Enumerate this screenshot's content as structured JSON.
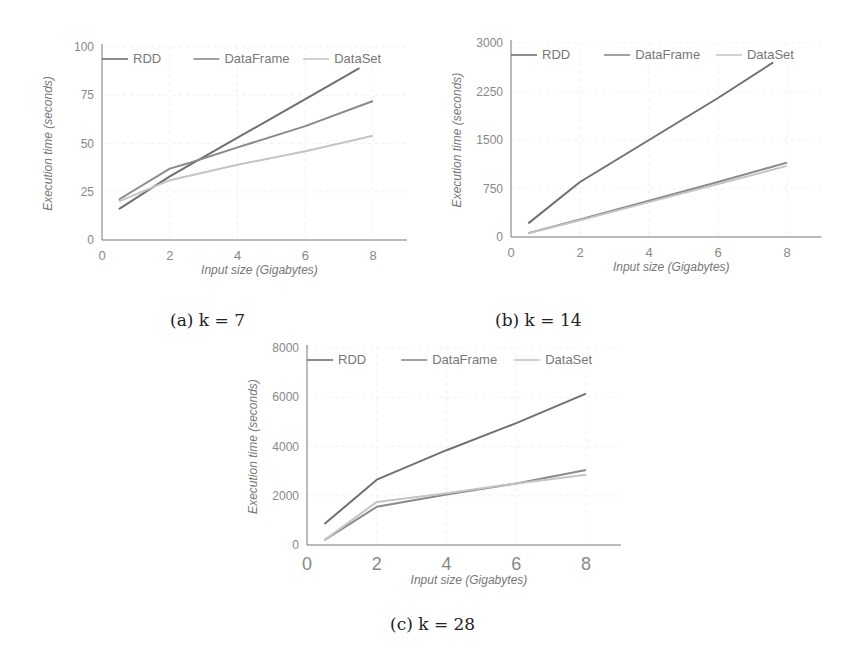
{
  "chart_data": [
    {
      "id": "a",
      "type": "line",
      "caption": "(a) k = 7",
      "xlabel": "Input size (Gigabytes)",
      "ylabel": "Execution time (seconds)",
      "xlim": [
        0,
        9
      ],
      "ylim": [
        0,
        100
      ],
      "xticks": [
        0,
        2,
        4,
        6,
        8
      ],
      "yticks": [
        0,
        25,
        50,
        75,
        100
      ],
      "grid": true,
      "legend_position": "top",
      "series": [
        {
          "name": "RDD",
          "color": "#707070",
          "x": [
            0.5,
            2,
            4,
            6,
            7.6
          ],
          "y": [
            16,
            33,
            53,
            73,
            89
          ]
        },
        {
          "name": "DataFrame",
          "color": "#8a8a8a",
          "x": [
            0.5,
            2,
            2.6,
            4,
            6,
            8
          ],
          "y": [
            21,
            37,
            40,
            48,
            59,
            72
          ]
        },
        {
          "name": "DataSet",
          "color": "#c4c4c4",
          "x": [
            0.5,
            2,
            4,
            6,
            8
          ],
          "y": [
            20,
            31,
            39,
            46,
            54
          ]
        }
      ]
    },
    {
      "id": "b",
      "type": "line",
      "caption": "(b) k = 14",
      "xlabel": "Input size (Gigabytes)",
      "ylabel": "Execution time (seconds)",
      "xlim": [
        0,
        9
      ],
      "ylim": [
        0,
        3000
      ],
      "xticks": [
        0,
        2,
        4,
        6,
        8
      ],
      "yticks": [
        0,
        750,
        1500,
        2250,
        3000
      ],
      "grid": true,
      "legend_position": "top",
      "series": [
        {
          "name": "RDD",
          "color": "#707070",
          "x": [
            0.5,
            2,
            4,
            6,
            7.6
          ],
          "y": [
            210,
            850,
            1500,
            2150,
            2700
          ]
        },
        {
          "name": "DataFrame",
          "color": "#8a8a8a",
          "x": [
            0.5,
            2,
            4,
            6,
            8
          ],
          "y": [
            60,
            270,
            560,
            850,
            1150
          ]
        },
        {
          "name": "DataSet",
          "color": "#c4c4c4",
          "x": [
            0.5,
            2,
            4,
            6,
            8
          ],
          "y": [
            55,
            260,
            540,
            820,
            1100
          ]
        }
      ]
    },
    {
      "id": "c",
      "type": "line",
      "caption": "(c) k = 28",
      "xlabel": "Input size (Gigabytes)",
      "ylabel": "Execution time (seconds)",
      "xlim": [
        0,
        9
      ],
      "ylim": [
        0,
        8000
      ],
      "xticks": [
        0,
        2,
        4,
        6,
        8
      ],
      "yticks": [
        0,
        2000,
        4000,
        6000,
        8000
      ],
      "grid": true,
      "legend_position": "top",
      "series": [
        {
          "name": "RDD",
          "color": "#707070",
          "x": [
            0.5,
            2,
            4,
            6,
            8
          ],
          "y": [
            850,
            2650,
            3850,
            4950,
            6150
          ]
        },
        {
          "name": "DataFrame",
          "color": "#8a8a8a",
          "x": [
            0.5,
            2,
            4,
            6,
            8
          ],
          "y": [
            200,
            1550,
            2050,
            2500,
            3050
          ]
        },
        {
          "name": "DataSet",
          "color": "#c4c4c4",
          "x": [
            0.5,
            2,
            4,
            6,
            8
          ],
          "y": [
            200,
            1750,
            2100,
            2500,
            2850
          ]
        }
      ]
    }
  ]
}
